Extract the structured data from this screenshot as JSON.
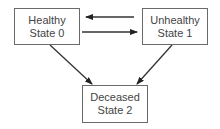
{
  "diagram": {
    "type": "state-transition",
    "nodes": [
      {
        "id": "healthy",
        "line1": "Healthy",
        "line2": "State 0"
      },
      {
        "id": "unhealthy",
        "line1": "Unhealthy",
        "line2": "State 1"
      },
      {
        "id": "deceased",
        "line1": "Deceased",
        "line2": "State 2"
      }
    ],
    "edges": [
      {
        "from": "unhealthy",
        "to": "healthy"
      },
      {
        "from": "healthy",
        "to": "unhealthy"
      },
      {
        "from": "healthy",
        "to": "deceased"
      },
      {
        "from": "unhealthy",
        "to": "deceased"
      }
    ],
    "colors": {
      "stroke": "#333333",
      "border": "#6a6a6a",
      "text": "#444444"
    }
  }
}
